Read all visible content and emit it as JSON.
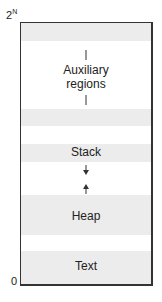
{
  "diagram": {
    "axis": {
      "top_label_base": "2",
      "top_label_exp": "N",
      "bottom_label": "0"
    },
    "regions": [
      {
        "name": "Auxiliary regions",
        "line1": "Auxiliary",
        "line2": "regions"
      },
      {
        "name": "Stack",
        "label": "Stack",
        "growth": "down"
      },
      {
        "name": "Heap",
        "label": "Heap",
        "growth": "up"
      },
      {
        "name": "Text",
        "label": "Text"
      }
    ],
    "colors": {
      "band": "#ececec",
      "border": "#333333"
    }
  }
}
